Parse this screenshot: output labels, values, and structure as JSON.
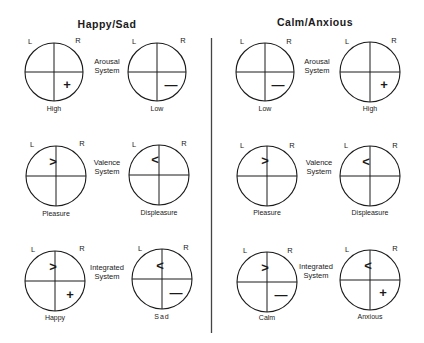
{
  "panels": [
    {
      "title": "Happy/Sad",
      "rows": [
        {
          "system_line1": "Arousal",
          "system_line2": "System",
          "left": {
            "L": "L",
            "R": "R",
            "caption": "High",
            "upper_symbol": "",
            "lower_symbol": "+"
          },
          "right": {
            "L": "L",
            "R": "R",
            "caption": "Low",
            "upper_symbol": "",
            "lower_symbol": "—"
          }
        },
        {
          "system_line1": "Valence",
          "system_line2": "System",
          "left": {
            "L": "L",
            "R": "R",
            "caption": "Pleasure",
            "upper_symbol": ">",
            "lower_symbol": ""
          },
          "right": {
            "L": "L",
            "R": "R",
            "caption": "Displeasure",
            "upper_symbol": "<",
            "lower_symbol": ""
          }
        },
        {
          "system_line1": "Integrated",
          "system_line2": "System",
          "left": {
            "L": "L",
            "R": "R",
            "caption": "Happy",
            "upper_symbol": ">",
            "lower_symbol": "+"
          },
          "right": {
            "L": "L",
            "R": "R",
            "caption": "Sad",
            "upper_symbol": "<",
            "lower_symbol": "—"
          }
        }
      ]
    },
    {
      "title": "Calm/Anxious",
      "rows": [
        {
          "system_line1": "Arousal",
          "system_line2": "System",
          "left": {
            "L": "L",
            "R": "R",
            "caption": "Low",
            "upper_symbol": "",
            "lower_symbol": "—"
          },
          "right": {
            "L": "L",
            "R": "R",
            "caption": "High",
            "upper_symbol": "",
            "lower_symbol": "+"
          }
        },
        {
          "system_line1": "Valence",
          "system_line2": "System",
          "left": {
            "L": "L",
            "R": "R",
            "caption": "Pleasure",
            "upper_symbol": ">",
            "lower_symbol": ""
          },
          "right": {
            "L": "L",
            "R": "R",
            "caption": "Displeasure",
            "upper_symbol": "<",
            "lower_symbol": ""
          }
        },
        {
          "system_line1": "Integrated",
          "system_line2": "System",
          "left": {
            "L": "L",
            "R": "R",
            "caption": "Calm",
            "upper_symbol": ">",
            "lower_symbol": "—"
          },
          "right": {
            "L": "L",
            "R": "R",
            "caption": "Anxious",
            "upper_symbol": "<",
            "lower_symbol": "+"
          }
        }
      ]
    }
  ]
}
